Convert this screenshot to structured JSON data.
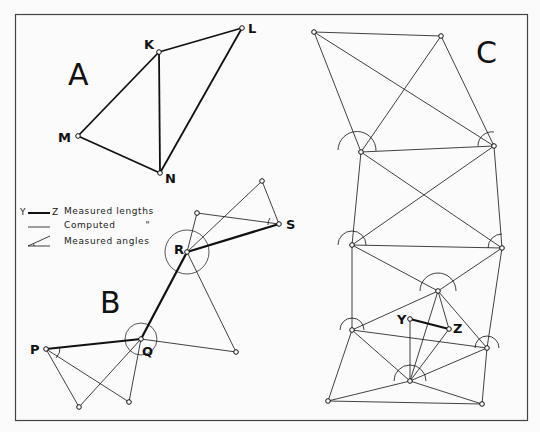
{
  "panels": {
    "A": {
      "label": "A",
      "points": {
        "K": "K",
        "L": "L",
        "M": "M",
        "N": "N"
      }
    },
    "B": {
      "label": "B",
      "points": {
        "P": "P",
        "Q": "Q",
        "R": "R",
        "S": "S"
      }
    },
    "C": {
      "label": "C",
      "points": {
        "Y": "Y",
        "Z": "Z"
      }
    }
  },
  "legend": {
    "measured_key": "Y",
    "measured_key_end": "Z",
    "measured_lengths": "Measured lengths",
    "computed": "Computed",
    "computed_ditto": "\"",
    "measured_angles": "Measured angles"
  }
}
